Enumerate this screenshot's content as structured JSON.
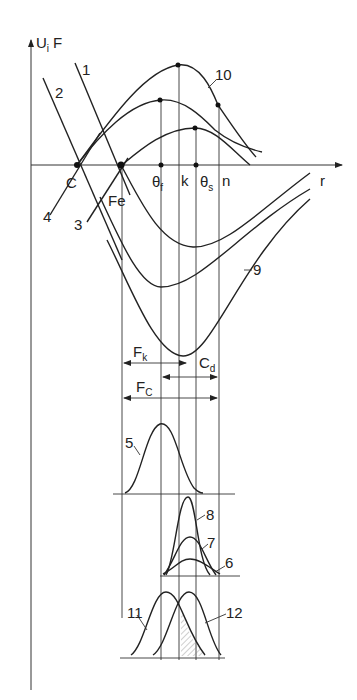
{
  "diagram": {
    "axes": {
      "y_label": "U",
      "y_label_sub": "i",
      "y_label_extra": "F",
      "x_label": "r"
    },
    "points": {
      "c": "C",
      "fe": "Fe",
      "theta_f": "θ",
      "theta_f_sub": "f",
      "k": "k",
      "theta_s": "θ",
      "theta_s_sub": "s",
      "n": "n"
    },
    "curve_labels": {
      "c1": "1",
      "c2": "2",
      "c3": "3",
      "c4": "4",
      "c5": "5",
      "c6": "6",
      "c7": "7",
      "c8": "8",
      "c9": "9",
      "c10": "10",
      "c11": "11",
      "c12": "12"
    },
    "ranges": {
      "fk": "F",
      "fk_sub": "k",
      "cd": "C",
      "cd_sub": "d",
      "fc": "F",
      "fc_sub": "C"
    }
  },
  "colors": {
    "line": "#222222",
    "background": "#ffffff",
    "hatch": "#888888"
  }
}
